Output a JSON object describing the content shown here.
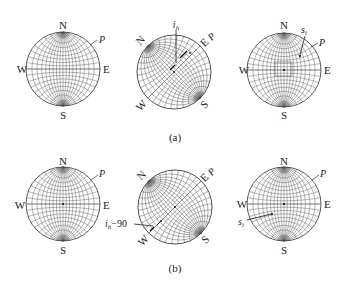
{
  "figure": {
    "panels": [
      {
        "id": "a",
        "caption": "(a)",
        "nets": [
          {
            "center": [
              63,
              69
            ],
            "radius": 37,
            "rotation_deg": 0,
            "labels": {
              "N": "N",
              "S": "S",
              "E": "E",
              "W": "W",
              "P": "P"
            },
            "annotation": null
          },
          {
            "center": [
              174,
              72
            ],
            "radius": 37,
            "rotation_deg": -45,
            "labels": {
              "N": "N",
              "S": "S",
              "E": "E",
              "W": "W",
              "P": "P"
            },
            "annotation": {
              "text": "i_h",
              "display": "i",
              "sub": "h"
            }
          },
          {
            "center": [
              284,
              70
            ],
            "radius": 37,
            "rotation_deg": 0,
            "labels": {
              "N": "N",
              "S": "S",
              "E": "E",
              "W": "W",
              "P": "P"
            },
            "annotation": {
              "text": "s_i",
              "display": "s",
              "sub": "i"
            }
          }
        ]
      },
      {
        "id": "b",
        "caption": "(b)",
        "nets": [
          {
            "center": [
              63,
              204
            ],
            "radius": 37,
            "rotation_deg": 0,
            "labels": {
              "N": "N",
              "S": "S",
              "E": "E",
              "W": "W",
              "P": "P"
            },
            "annotation": null
          },
          {
            "center": [
              175,
              207
            ],
            "radius": 37,
            "rotation_deg": -45,
            "labels": {
              "N": "N",
              "S": "S",
              "E": "E",
              "W": "W",
              "P": "P"
            },
            "annotation": {
              "text": "i_h−90",
              "display": "i",
              "sub": "h",
              "suffix": "−90"
            }
          },
          {
            "center": [
              284,
              204
            ],
            "radius": 37,
            "rotation_deg": 0,
            "labels": {
              "N": "N",
              "S": "S",
              "E": "E",
              "W": "W",
              "P": "P"
            },
            "annotation": {
              "text": "s_i",
              "display": "s",
              "sub": "i"
            }
          }
        ]
      }
    ],
    "captions": {
      "a": "(a)",
      "b": "(b)"
    },
    "colors": {
      "line": "#555555",
      "rim": "#333333",
      "text": "#222222"
    }
  }
}
